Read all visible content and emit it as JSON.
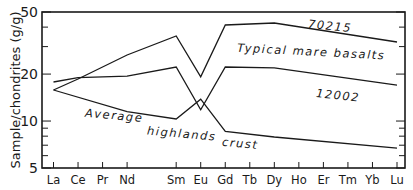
{
  "chart_data": {
    "type": "line",
    "title": "",
    "xlabel": "",
    "ylabel": "Sample/chondrites (g/g)",
    "yscale": "log",
    "ylim": [
      5,
      50
    ],
    "yticks": [
      5,
      10,
      20,
      50
    ],
    "yticks_minor": [
      6,
      7,
      8,
      9,
      30,
      40
    ],
    "grid": false,
    "legend": "none (series labelled by in-plot annotations)",
    "categories": [
      "La",
      "Ce",
      "Pr",
      "Nd",
      "Sm",
      "Eu",
      "Gd",
      "Tb",
      "Dy",
      "Ho",
      "Er",
      "Tm",
      "Yb",
      "Lu"
    ],
    "category_slots": [
      "La",
      "Ce",
      "Pr",
      "Nd",
      "Pm",
      "Sm",
      "Eu",
      "Gd",
      "Tb",
      "Dy",
      "Ho",
      "Er",
      "Tm",
      "Yb",
      "Lu"
    ],
    "series": [
      {
        "name": "70215",
        "group": "Typical mare basalts",
        "points": [
          [
            "La",
            15.8
          ],
          [
            "Ce",
            18.6
          ],
          [
            "Nd",
            26.5
          ],
          [
            "Sm",
            35.1
          ],
          [
            "Eu",
            19.2
          ],
          [
            "Gd",
            41.3
          ],
          [
            "Dy",
            42.5
          ],
          [
            "Lu",
            32.1
          ]
        ]
      },
      {
        "name": "12002",
        "group": "Typical mare basalts",
        "points": [
          [
            "La",
            17.8
          ],
          [
            "Ce",
            19.0
          ],
          [
            "Nd",
            19.4
          ],
          [
            "Sm",
            22.2
          ],
          [
            "Eu",
            11.8
          ],
          [
            "Gd",
            22.2
          ],
          [
            "Dy",
            21.9
          ],
          [
            "Lu",
            17.0
          ]
        ]
      },
      {
        "name": "Average highlands crust",
        "group": "Average highlands crust",
        "points": [
          [
            "La",
            15.8
          ],
          [
            "Nd",
            11.5
          ],
          [
            "Sm",
            10.3
          ],
          [
            "Eu",
            13.8
          ],
          [
            "Gd",
            8.6
          ],
          [
            "Dy",
            7.9
          ],
          [
            "Lu",
            6.7
          ]
        ]
      }
    ],
    "annotations": [
      {
        "text": "70215",
        "near_series": "70215"
      },
      {
        "text": "Typical mare basalts",
        "between_series": [
          "70215",
          "12002"
        ]
      },
      {
        "text": "12002",
        "near_series": "12002"
      },
      {
        "text": "Average",
        "near_series": "Average highlands crust"
      },
      {
        "text": "highlands",
        "near_series": "Average highlands crust"
      },
      {
        "text": "crust",
        "near_series": "Average highlands crust"
      }
    ]
  },
  "labels": {
    "ylabel": "Sample/chondrites (g/g)",
    "y50": "50",
    "y20": "20",
    "y10": "10",
    "y5": "5",
    "anno_70215": "70215",
    "anno_mare": "Typical  mare  basalts",
    "anno_12002": "12002",
    "anno_average": "Average",
    "anno_highlands": "highlands",
    "anno_crust": "crust"
  }
}
